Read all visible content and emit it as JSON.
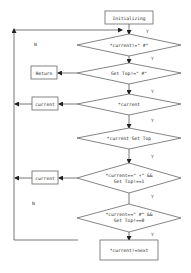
{
  "flowchart": {
    "start": {
      "label": "Initializing"
    },
    "decisions": [
      {
        "id": "d1",
        "label_lines": [
          "*current!=\" #\""
        ],
        "yes_label": "Y",
        "no_label": "N"
      },
      {
        "id": "d2",
        "label_lines": [
          "Get Top!=\" #\""
        ],
        "yes_label": "Y"
      },
      {
        "id": "d3",
        "label_lines": [
          "*current"
        ],
        "yes_label": "Y"
      },
      {
        "id": "d4",
        "label_lines": [
          "*current Get Top"
        ],
        "yes_label": "Y"
      },
      {
        "id": "d5",
        "label_lines": [
          "*current==\" +\" &&",
          "Get Top!==1"
        ],
        "yes_label": "Y"
      },
      {
        "id": "d6",
        "label_lines": [
          "*current==\" #\" &&",
          "Get Top!==0"
        ],
        "yes_label": "Y",
        "no_label": "N"
      }
    ],
    "side_boxes": [
      {
        "id": "b1",
        "label": "Return"
      },
      {
        "id": "b2",
        "label": "current"
      },
      {
        "id": "b3",
        "label": "current"
      }
    ],
    "end": {
      "label": "*current!=next"
    }
  }
}
